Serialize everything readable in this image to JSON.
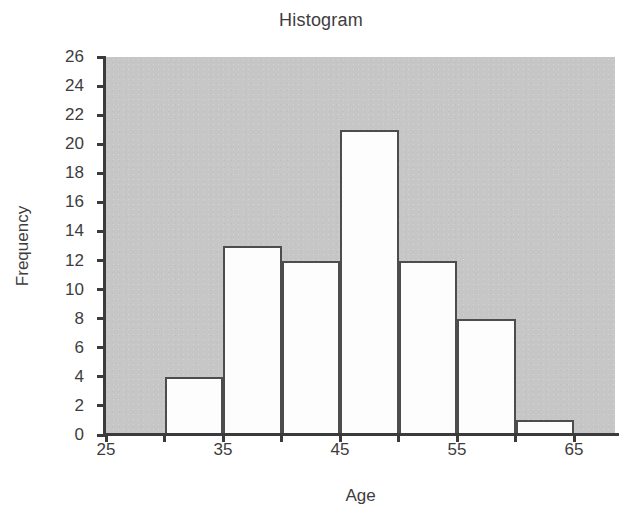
{
  "chart_data": {
    "type": "bar",
    "title": "Histogram",
    "xlabel": "Age",
    "ylabel": "Frequency",
    "categories": [
      "30-35",
      "35-40",
      "40-45",
      "45-50",
      "50-55",
      "55-60",
      "60-65"
    ],
    "bin_edges": [
      30,
      35,
      40,
      45,
      50,
      55,
      60,
      65
    ],
    "values": [
      4,
      13,
      12,
      21,
      12,
      8,
      1
    ],
    "xlim": [
      25,
      68.5
    ],
    "ylim": [
      0,
      26
    ],
    "x_tick_values": [
      25,
      30,
      35,
      40,
      45,
      50,
      55,
      60,
      65
    ],
    "x_tick_labels": [
      "25",
      "",
      "35",
      "",
      "45",
      "",
      "55",
      "",
      "65"
    ],
    "y_tick_values": [
      0,
      2,
      4,
      6,
      8,
      10,
      12,
      14,
      16,
      18,
      20,
      22,
      24,
      26
    ],
    "y_tick_labels": [
      "0",
      "2",
      "4",
      "6",
      "8",
      "10",
      "12",
      "14",
      "16",
      "18",
      "20",
      "22",
      "24",
      "26"
    ],
    "grid": false,
    "legend": false,
    "colors": {
      "plot_background": "#c6c6c6",
      "bar_fill": "#fdfdfd",
      "bar_edge": "#4d4d4d",
      "axis": "#3b3b3b",
      "text": "#3d3d3d",
      "figure_background": "#ffffff"
    }
  }
}
